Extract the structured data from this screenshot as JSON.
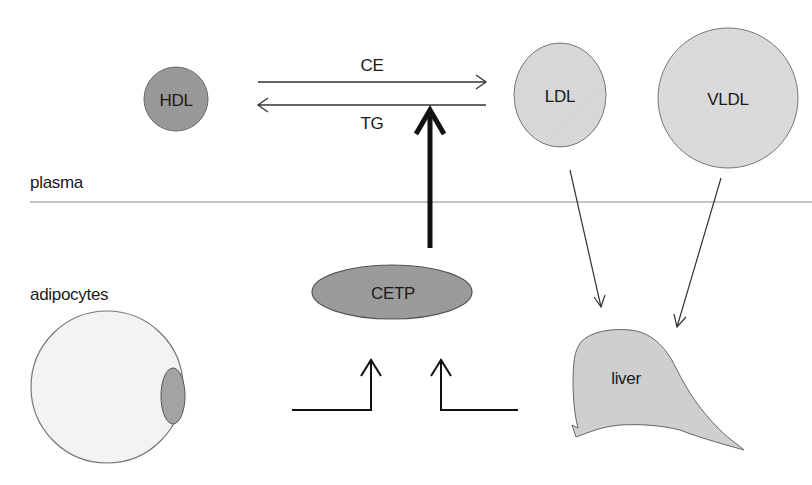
{
  "diagram": {
    "title": "",
    "regions": {
      "plasma": "plasma",
      "adipocytes": "adipocytes"
    },
    "nodes": {
      "hdl": "HDL",
      "ldl": "LDL",
      "vldl": "VLDL",
      "cetp": "CETP",
      "liver": "liver"
    },
    "edges": {
      "ce": "CE",
      "tg": "TG"
    },
    "colors": {
      "hdl_fill": "#9a9a9a",
      "ldl_fill": "#d9d9d9",
      "vldl_fill": "#dcdcdc",
      "cetp_fill": "#9c9c9c",
      "liver_fill": "#cfcfcf",
      "adipocyte_fill": "#f3f3f3",
      "adipocyte_nucleus_fill": "#a3a3a3",
      "line": "#333333"
    }
  }
}
